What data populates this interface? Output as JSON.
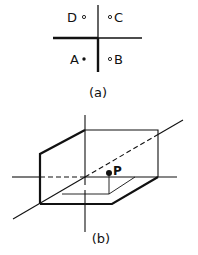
{
  "figure_a": {
    "caption": "(a)",
    "points": [
      {
        "label": "D",
        "marker": "open"
      },
      {
        "label": "C",
        "marker": "open"
      },
      {
        "label": "A",
        "marker": "filled"
      },
      {
        "label": "B",
        "marker": "open"
      }
    ]
  },
  "figure_b": {
    "caption": "(b)",
    "point_label": "P"
  },
  "colors": {
    "ink": "#111111",
    "background": "#ffffff"
  }
}
